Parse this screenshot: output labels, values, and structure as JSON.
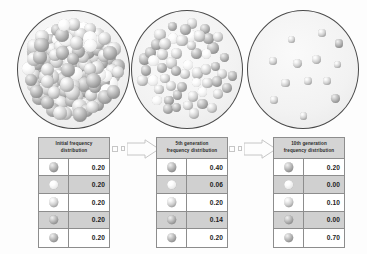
{
  "figure": {
    "background_color": "#fdfdfd",
    "bead_color_dark": "#8a8a8a",
    "bead_color_mid": "#cfcfcf",
    "bead_color_light": "#fdfdfd",
    "dish_border_color": "#4a4a4a",
    "table_border_color": "#8d8d8d",
    "header_fill_color": "#d4d4d4",
    "row_alt_fill_color": "#d0d0d0",
    "arrow_outline_color": "#c6c6c6"
  },
  "dishes": [
    {
      "name": "initial-population-dish",
      "label": "Initial population",
      "density": "very-high",
      "bead_count": 120
    },
    {
      "name": "fifth-generation-dish",
      "label": "5th generation population",
      "density": "medium",
      "bead_count": 56
    },
    {
      "name": "tenth-generation-dish",
      "label": "10th generation population",
      "density": "low",
      "bead_count": 13
    }
  ],
  "tables": [
    {
      "name": "initial-frequency-table",
      "header_line1": "Initial frequency",
      "header_line2": "distribution",
      "rows": [
        {
          "allele": "allele-1",
          "shade": "dark",
          "value": "0.20"
        },
        {
          "allele": "allele-2",
          "shade": "light",
          "value": "0.20"
        },
        {
          "allele": "allele-3",
          "shade": "mid",
          "value": "0.20"
        },
        {
          "allele": "allele-4",
          "shade": "dark",
          "value": "0.20"
        },
        {
          "allele": "allele-5",
          "shade": "dark",
          "value": "0.20"
        }
      ]
    },
    {
      "name": "fifth-generation-frequency-table",
      "header_line1": "5th generation",
      "header_line2": "frequency distribution",
      "rows": [
        {
          "allele": "allele-1",
          "shade": "dark",
          "value": "0.40"
        },
        {
          "allele": "allele-2",
          "shade": "light",
          "value": "0.06"
        },
        {
          "allele": "allele-3",
          "shade": "mid",
          "value": "0.20"
        },
        {
          "allele": "allele-4",
          "shade": "dark",
          "value": "0.14"
        },
        {
          "allele": "allele-5",
          "shade": "dark",
          "value": "0.20"
        }
      ]
    },
    {
      "name": "tenth-generation-frequency-table",
      "header_line1": "10th generation",
      "header_line2": "frequency distribution",
      "rows": [
        {
          "allele": "allele-1",
          "shade": "dark",
          "value": "0.20"
        },
        {
          "allele": "allele-2",
          "shade": "light",
          "value": "0.00"
        },
        {
          "allele": "allele-3",
          "shade": "mid",
          "value": "0.10"
        },
        {
          "allele": "allele-4",
          "shade": "dark",
          "value": "0.00"
        },
        {
          "allele": "allele-5",
          "shade": "dark",
          "value": "0.70"
        }
      ]
    }
  ],
  "arrows": [
    {
      "name": "arrow-initial-to-fifth",
      "direction": "right",
      "style": "hollow-outline"
    },
    {
      "name": "arrow-fifth-to-tenth",
      "direction": "right",
      "style": "hollow-outline"
    }
  ],
  "chart_data": {
    "type": "bar",
    "categories": [
      "allele-1",
      "allele-2",
      "allele-3",
      "allele-4",
      "allele-5"
    ],
    "series": [
      {
        "name": "Initial frequency distribution",
        "values": [
          0.2,
          0.2,
          0.2,
          0.2,
          0.2
        ]
      },
      {
        "name": "5th generation frequency distribution",
        "values": [
          0.4,
          0.06,
          0.2,
          0.14,
          0.2
        ]
      },
      {
        "name": "10th generation frequency distribution",
        "values": [
          0.2,
          0.0,
          0.1,
          0.0,
          0.7
        ]
      }
    ],
    "xlabel": "Allele",
    "ylabel": "Frequency",
    "ylim": [
      0,
      1
    ],
    "grid": false,
    "legend": "none"
  }
}
